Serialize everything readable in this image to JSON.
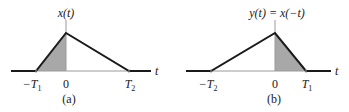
{
  "panels": [
    {
      "id": "a",
      "caption": "(a)",
      "title": "x(t)",
      "axis_label": "t",
      "ticks": [
        {
          "base": "−T",
          "sub": "1"
        },
        {
          "base": "0",
          "sub": ""
        },
        {
          "base": "T",
          "sub": "2"
        }
      ],
      "shaded_region": "from −T1 to 0"
    },
    {
      "id": "b",
      "caption": "(b)",
      "title": "y(t) = x(−t)",
      "axis_label": "t",
      "ticks": [
        {
          "base": "−T",
          "sub": "2"
        },
        {
          "base": "0",
          "sub": ""
        },
        {
          "base": "T",
          "sub": "1"
        }
      ],
      "shaded_region": "from 0 to T1"
    }
  ],
  "colors": {
    "signal": "#1a1a1a",
    "axis": "#9a9a9a",
    "shade": "#a8a8a8"
  }
}
